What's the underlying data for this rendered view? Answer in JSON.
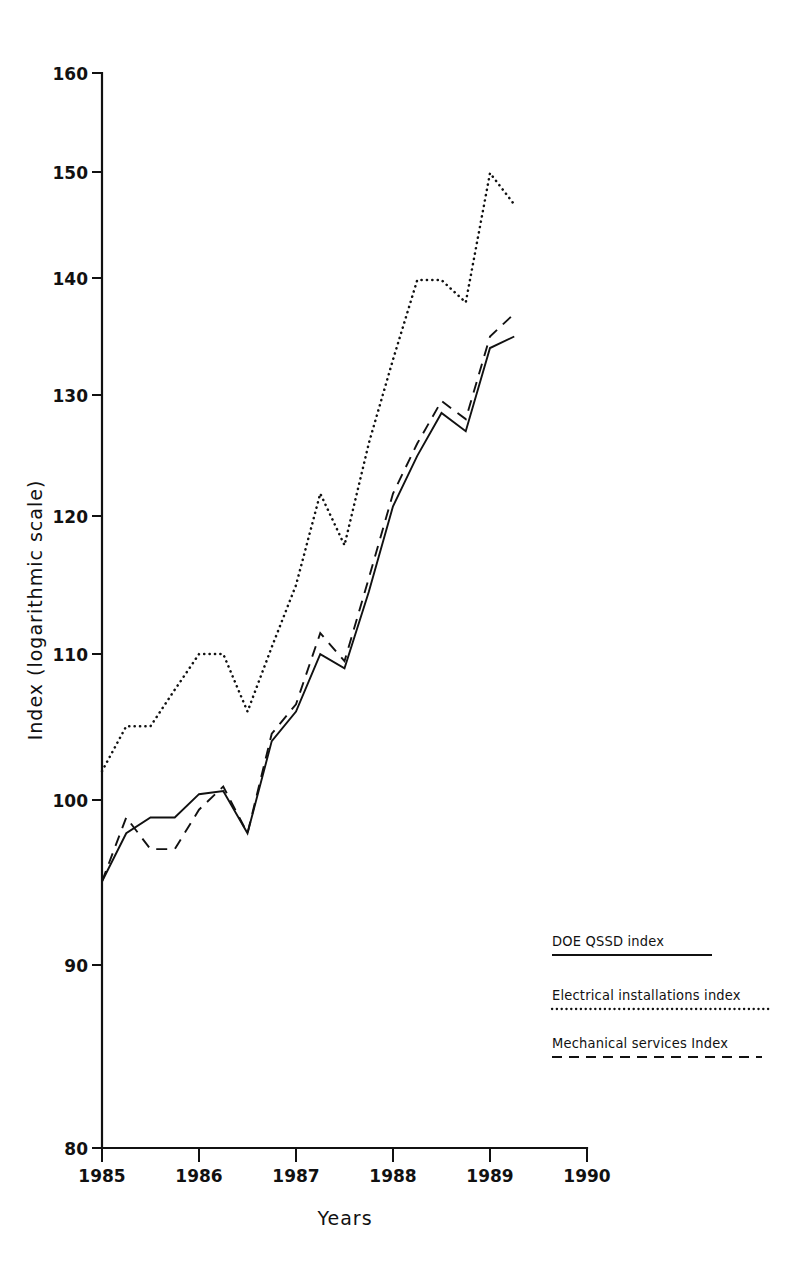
{
  "chart_data": {
    "type": "line",
    "title": "",
    "subtitle": "",
    "xlabel": "Years",
    "ylabel": "Index (logarithmic scale)",
    "scale": "logarithmic",
    "grid": false,
    "legend_position": "bottom-right",
    "xlim": [
      1985,
      1990
    ],
    "ylim": [
      80,
      160
    ],
    "xticks": [
      "1985",
      "1986",
      "1987",
      "1988",
      "1989",
      "1990"
    ],
    "xtick_values": [
      1985,
      1986,
      1987,
      1988,
      1989,
      1990
    ],
    "yticks": [
      "80",
      "90",
      "100",
      "110",
      "120",
      "130",
      "140",
      "150",
      "160"
    ],
    "ytick_values": [
      80,
      90,
      100,
      110,
      120,
      130,
      140,
      150,
      160
    ],
    "x": [
      1985.0,
      1985.25,
      1985.5,
      1985.75,
      1986.0,
      1986.25,
      1986.5,
      1986.75,
      1987.0,
      1987.25,
      1987.5,
      1987.75,
      1988.0,
      1988.25,
      1988.5,
      1988.75,
      1989.0,
      1989.25,
      1989.5
    ],
    "series": [
      {
        "name": "DOE QSSD index",
        "style": "solid",
        "color": "#111111",
        "values": [
          95.0,
          98.0,
          99.0,
          99.0,
          100.5,
          100.7,
          98.0,
          104.0,
          106.0,
          110.0,
          109.0,
          114.5,
          121.0,
          125.0,
          128.5,
          127.0,
          134.0,
          135.0,
          null
        ]
      },
      {
        "name": "Electrical installations index",
        "style": "dotted",
        "color": "#111111",
        "values": [
          102.0,
          105.0,
          105.0,
          107.5,
          110.0,
          110.0,
          106.0,
          110.5,
          115.0,
          122.0,
          118.0,
          126.0,
          133.0,
          140.0,
          140.0,
          138.0,
          150.0,
          147.0,
          null
        ]
      },
      {
        "name": "Mechanical services Index",
        "style": "dashed",
        "color": "#111111",
        "values": [
          95.0,
          99.0,
          97.0,
          97.0,
          99.5,
          101.0,
          98.0,
          104.5,
          106.5,
          111.5,
          109.5,
          115.5,
          122.0,
          126.0,
          129.5,
          128.0,
          135.0,
          137.0,
          null
        ]
      }
    ]
  },
  "legend": {
    "items": [
      {
        "label": "DOE QSSD index",
        "style": "solid"
      },
      {
        "label": "Electrical installations index",
        "style": "dotted"
      },
      {
        "label": "Mechanical services Index",
        "style": "dashed"
      }
    ]
  },
  "axes": {
    "y_axis_title": "Index (logarithmic scale)",
    "x_axis_title": "Years"
  }
}
